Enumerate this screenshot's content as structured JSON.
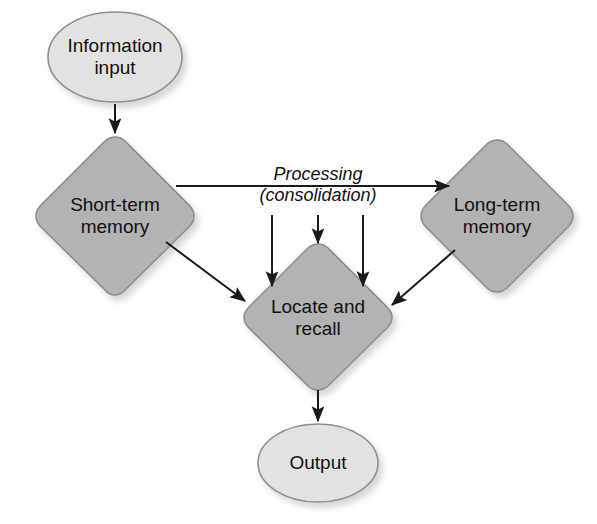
{
  "diagram": {
    "colors": {
      "ellipse_fill": "#e2e2e2",
      "diamond_fill": "#b3b3b3",
      "shape_stroke": "#8c8c8c",
      "arrow_color": "#1a1a1a",
      "background": "#ffffff",
      "text": "#111111",
      "shadow": "#b9b9b9"
    },
    "nodes": [
      {
        "id": "information-input",
        "label": "Information\ninput",
        "shape": "ellipse",
        "cx": 115,
        "cy": 57,
        "rx": 67,
        "ry": 45
      },
      {
        "id": "short-term-memory",
        "label": "Short-term\nmemory",
        "shape": "diamond",
        "cx": 115,
        "cy": 215,
        "half": 78
      },
      {
        "id": "long-term-memory",
        "label": "Long-term\nmemory",
        "shape": "diamond",
        "cx": 497,
        "cy": 215,
        "half": 75
      },
      {
        "id": "locate-and-recall",
        "label": "Locate and\nrecall",
        "shape": "diamond",
        "cx": 318,
        "cy": 317,
        "half": 73
      },
      {
        "id": "output",
        "label": "Output",
        "shape": "ellipse",
        "cx": 318,
        "cy": 463,
        "rx": 60,
        "ry": 39
      }
    ],
    "edges": [
      {
        "id": "input-to-short-term",
        "from": "information-input",
        "to": "short-term-memory",
        "kind": "vertical-arrow"
      },
      {
        "id": "short-term-to-long-term",
        "from": "short-term-memory",
        "to": "long-term-memory",
        "kind": "horizontal-arrow",
        "label": "Processing\n(consolidation)"
      },
      {
        "id": "processing-drop-left",
        "from": "processing-line",
        "to": "locate-and-recall",
        "kind": "vertical-arrow"
      },
      {
        "id": "processing-drop-center",
        "from": "processing-line",
        "to": "locate-and-recall",
        "kind": "vertical-arrow"
      },
      {
        "id": "processing-drop-right",
        "from": "processing-line",
        "to": "locate-and-recall",
        "kind": "vertical-arrow"
      },
      {
        "id": "short-term-to-locate",
        "from": "short-term-memory",
        "to": "locate-and-recall",
        "kind": "diagonal-arrow"
      },
      {
        "id": "long-term-to-locate",
        "from": "long-term-memory",
        "to": "locate-and-recall",
        "kind": "diagonal-arrow"
      },
      {
        "id": "locate-to-output",
        "from": "locate-and-recall",
        "to": "output",
        "kind": "vertical-arrow"
      }
    ],
    "edge_labels": {
      "processing": "Processing\n(consolidation)"
    }
  }
}
